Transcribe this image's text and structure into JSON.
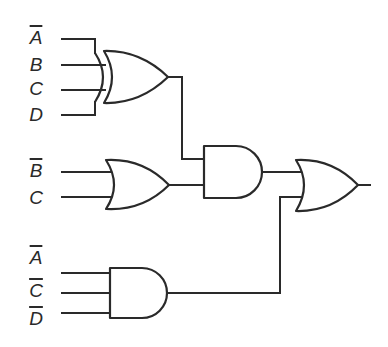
{
  "diagram": {
    "type": "logic-circuit",
    "colors": {
      "stroke": "#2a2a2a",
      "background": "#ffffff"
    },
    "inputs": [
      {
        "id": "in-a-bar-1",
        "label": "A",
        "negated": true,
        "x": 28,
        "y": 28
      },
      {
        "id": "in-b-1",
        "label": "B",
        "negated": false,
        "x": 28,
        "y": 54
      },
      {
        "id": "in-c-1",
        "label": "C",
        "negated": false,
        "x": 28,
        "y": 79
      },
      {
        "id": "in-d-1",
        "label": "D",
        "negated": false,
        "x": 28,
        "y": 104
      },
      {
        "id": "in-b-bar-2",
        "label": "B",
        "negated": true,
        "x": 28,
        "y": 161
      },
      {
        "id": "in-c-2",
        "label": "C",
        "negated": false,
        "x": 28,
        "y": 188
      },
      {
        "id": "in-a-bar-3",
        "label": "A",
        "negated": true,
        "x": 28,
        "y": 248
      },
      {
        "id": "in-c-bar-3",
        "label": "C",
        "negated": true,
        "x": 28,
        "y": 281
      },
      {
        "id": "in-d-bar-3",
        "label": "D",
        "negated": true,
        "x": 28,
        "y": 309
      }
    ],
    "gates": [
      {
        "id": "g1",
        "type": "XOR",
        "inputs": [
          "A'",
          "B",
          "C",
          "D"
        ]
      },
      {
        "id": "g2",
        "type": "OR",
        "inputs": [
          "B'",
          "C"
        ]
      },
      {
        "id": "g3",
        "type": "AND",
        "inputs": [
          "g1",
          "g2"
        ]
      },
      {
        "id": "g4",
        "type": "AND",
        "inputs": [
          "A'",
          "C'",
          "D'"
        ]
      },
      {
        "id": "g5",
        "type": "OR",
        "inputs": [
          "g3",
          "g4"
        ],
        "output": true
      }
    ]
  }
}
